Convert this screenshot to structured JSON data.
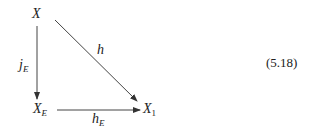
{
  "diagram": {
    "type": "commutative-diagram",
    "nodes": {
      "top": {
        "base": "X",
        "sub": ""
      },
      "bottom_left": {
        "base": "X",
        "sub": "E"
      },
      "bottom_right": {
        "base": "X",
        "sub": "1"
      }
    },
    "arrows": {
      "vertical": {
        "base": "j",
        "sub": "E",
        "from": "X",
        "to": "X_E"
      },
      "diagonal": {
        "base": "h",
        "sub": "",
        "from": "X",
        "to": "X_1"
      },
      "horizontal": {
        "base": "h",
        "sub": "E",
        "from": "X_E",
        "to": "X_1"
      }
    },
    "equation_number": "(5.18)"
  }
}
